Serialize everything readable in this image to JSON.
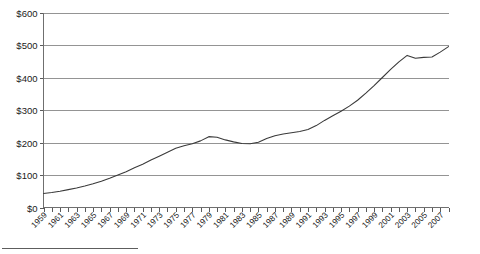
{
  "chart_data": {
    "type": "line",
    "title": "",
    "xlabel": "",
    "ylabel": "",
    "grid": true,
    "legend": false,
    "ylim": [
      0,
      600
    ],
    "ytick_labels": [
      "$0",
      "$100",
      "$200",
      "$300",
      "$400",
      "$500",
      "$600"
    ],
    "ytick_values": [
      0,
      100,
      200,
      300,
      400,
      500,
      600
    ],
    "xlim": [
      1959,
      2008
    ],
    "xtick_labels": [
      "1959",
      "1961",
      "1963",
      "1965",
      "1967",
      "1969",
      "1971",
      "1973",
      "1975",
      "1977",
      "1979",
      "1981",
      "1983",
      "1985",
      "1987",
      "1989",
      "1991",
      "1993",
      "1995",
      "1997",
      "1999",
      "2001",
      "2003",
      "2005",
      "2007"
    ],
    "x": [
      1959,
      1960,
      1961,
      1962,
      1963,
      1964,
      1965,
      1966,
      1967,
      1968,
      1969,
      1970,
      1971,
      1972,
      1973,
      1974,
      1975,
      1976,
      1977,
      1978,
      1979,
      1980,
      1981,
      1982,
      1983,
      1984,
      1985,
      1986,
      1987,
      1988,
      1989,
      1990,
      1991,
      1992,
      1993,
      1994,
      1995,
      1996,
      1997,
      1998,
      1999,
      2000,
      2001,
      2002,
      2003,
      2004,
      2005,
      2006,
      2007,
      2008
    ],
    "values": [
      43,
      46,
      50,
      55,
      60,
      66,
      73,
      81,
      90,
      100,
      110,
      122,
      133,
      146,
      158,
      170,
      182,
      190,
      196,
      205,
      218,
      216,
      208,
      202,
      197,
      196,
      201,
      212,
      221,
      226,
      230,
      234,
      240,
      252,
      268,
      282,
      296,
      312,
      330,
      352,
      375,
      400,
      425,
      448,
      468,
      459,
      462,
      463,
      478,
      495
    ],
    "series": [
      {
        "name": "value",
        "values": [
          43,
          46,
          50,
          55,
          60,
          66,
          73,
          81,
          90,
          100,
          110,
          122,
          133,
          146,
          158,
          170,
          182,
          190,
          196,
          205,
          218,
          216,
          208,
          202,
          197,
          196,
          201,
          212,
          221,
          226,
          230,
          234,
          240,
          252,
          268,
          282,
          296,
          312,
          330,
          352,
          375,
          400,
          425,
          448,
          468,
          459,
          462,
          463,
          478,
          495
        ]
      }
    ],
    "line_color": "#3a3a3a",
    "grid_color": "#949494",
    "background_color": "#ffffff"
  },
  "footer": {
    "rule": ""
  }
}
